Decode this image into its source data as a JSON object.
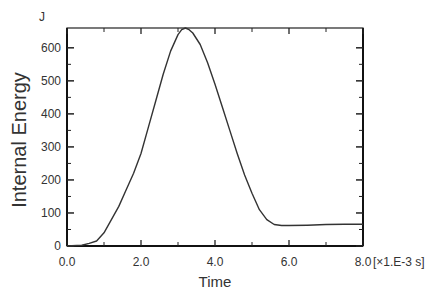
{
  "chart_data": {
    "type": "line",
    "title": "",
    "xlabel": "Time",
    "ylabel": "Internal Energy",
    "y_unit": "J",
    "x_unit": "[×1.E-3  s]",
    "xlim": [
      0,
      8.0
    ],
    "ylim": [
      0,
      660
    ],
    "x_ticks": [
      "0.0",
      "2.0",
      "4.0",
      "6.0",
      "8.0"
    ],
    "y_ticks": [
      "0",
      "100",
      "200",
      "300",
      "400",
      "500",
      "600"
    ],
    "grid": false,
    "legend": null,
    "series": [
      {
        "name": "Internal Energy",
        "x": [
          0.0,
          0.4,
          0.6,
          0.8,
          1.0,
          1.2,
          1.4,
          1.6,
          1.8,
          2.0,
          2.2,
          2.4,
          2.6,
          2.8,
          3.0,
          3.1,
          3.2,
          3.3,
          3.4,
          3.6,
          3.8,
          4.0,
          4.2,
          4.4,
          4.6,
          4.8,
          5.0,
          5.2,
          5.4,
          5.6,
          5.8,
          6.0,
          6.5,
          7.0,
          7.5,
          8.0
        ],
        "values": [
          0,
          2,
          8,
          15,
          40,
          80,
          120,
          170,
          220,
          280,
          360,
          440,
          520,
          590,
          640,
          655,
          660,
          655,
          645,
          610,
          555,
          490,
          420,
          350,
          280,
          215,
          160,
          110,
          80,
          65,
          62,
          62,
          63,
          65,
          66,
          66
        ]
      }
    ]
  }
}
